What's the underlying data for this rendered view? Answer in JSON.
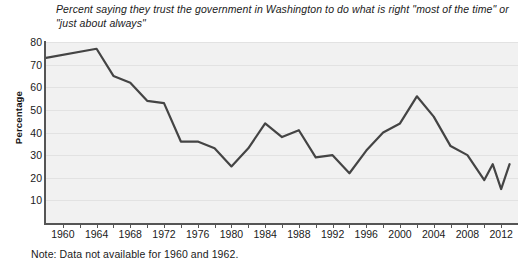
{
  "title": "Percent saying they trust the government in Washington to do what is right \"most of the time\" or \"just about always\"",
  "note": "Note: Data not available for 1960 and 1962.",
  "axes": {
    "ylabel": "Percentage",
    "yticks": [
      10,
      20,
      30,
      40,
      50,
      60,
      70,
      80
    ],
    "xticks_labeled": [
      1960,
      1964,
      1968,
      1972,
      1976,
      1980,
      1984,
      1988,
      1992,
      1996,
      2000,
      2004,
      2008,
      2012
    ],
    "xticks_all": [
      1960,
      1962,
      1964,
      1966,
      1968,
      1970,
      1972,
      1974,
      1976,
      1978,
      1980,
      1982,
      1984,
      1986,
      1988,
      1990,
      1992,
      1994,
      1996,
      1998,
      2000,
      2002,
      2004,
      2006,
      2008,
      2010,
      2012
    ],
    "line_color": "#444444",
    "plot_background": "#f1f1f1",
    "grid_color": "#e2e2e2"
  },
  "chart_data": {
    "type": "line",
    "title": "Percent saying they trust the government in Washington to do what is right \"most of the time\" or \"just about always\"",
    "xlabel": "",
    "ylabel": "Percentage",
    "xlim": [
      1958,
      2014
    ],
    "ylim": [
      0,
      80
    ],
    "grid": true,
    "legend": null,
    "annotations": [
      "Note: Data not available for 1960 and 1962."
    ],
    "x": [
      1958,
      1964,
      1966,
      1968,
      1970,
      1972,
      1974,
      1976,
      1978,
      1980,
      1982,
      1984,
      1986,
      1988,
      1990,
      1992,
      1994,
      1996,
      1998,
      2000,
      2002,
      2004,
      2006,
      2008,
      2010,
      2011,
      2012,
      2013
    ],
    "values": [
      73,
      77,
      65,
      62,
      54,
      53,
      36,
      36,
      33,
      25,
      33,
      44,
      38,
      41,
      29,
      30,
      22,
      32,
      40,
      44,
      56,
      47,
      34,
      30,
      19,
      26,
      15,
      26
    ],
    "series": [
      {
        "name": "Trust the government in Washington",
        "values": [
          73,
          77,
          65,
          62,
          54,
          53,
          36,
          36,
          33,
          25,
          33,
          44,
          38,
          41,
          29,
          30,
          22,
          32,
          40,
          44,
          56,
          47,
          34,
          30,
          19,
          26,
          15,
          26
        ]
      }
    ]
  }
}
